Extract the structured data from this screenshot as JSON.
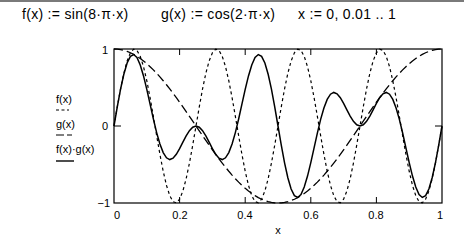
{
  "definitions": [
    {
      "text": "f(x) := sin(8·π·x)"
    },
    {
      "text": "g(x) := cos(2·π·x)"
    },
    {
      "text": "x := 0, 0.01 .. 1"
    }
  ],
  "legend": [
    {
      "label": "f(x)",
      "style": "dotted"
    },
    {
      "label": "g(x)",
      "style": "dashed"
    },
    {
      "label": "f(x)·g(x)",
      "style": "solid"
    }
  ],
  "axes": {
    "xlabel": "x",
    "x_ticks": [
      "0",
      "0.2",
      "0.4",
      "0.6",
      "0.8",
      "1"
    ],
    "y_ticks": [
      "1",
      "0",
      "−1"
    ]
  },
  "colors": {
    "line": "#000000",
    "frame": "#000000",
    "background": "#ffffff"
  },
  "chart_data": {
    "type": "line",
    "title": "",
    "xlabel": "x",
    "ylabel": "",
    "xlim": [
      0,
      1
    ],
    "ylim": [
      -1,
      1
    ],
    "x_ticks": [
      0,
      0.2,
      0.4,
      0.6,
      0.8,
      1
    ],
    "y_ticks": [
      -1,
      0,
      1
    ],
    "grid": false,
    "legend_position": "left",
    "x": {
      "start": 0,
      "step": 0.01,
      "end": 1
    },
    "series": [
      {
        "name": "f(x)",
        "expression": "sin(8·π·x)",
        "style": "dotted",
        "sample_points": [
          [
            0,
            0
          ],
          [
            0.0625,
            1
          ],
          [
            0.125,
            0
          ],
          [
            0.1875,
            -1
          ],
          [
            0.25,
            0
          ],
          [
            0.3125,
            1
          ],
          [
            0.375,
            0
          ],
          [
            0.4375,
            -1
          ],
          [
            0.5,
            0
          ],
          [
            0.5625,
            1
          ],
          [
            0.625,
            0
          ],
          [
            0.6875,
            -1
          ],
          [
            0.75,
            0
          ],
          [
            0.8125,
            1
          ],
          [
            0.875,
            0
          ],
          [
            0.9375,
            -1
          ],
          [
            1,
            0
          ]
        ]
      },
      {
        "name": "g(x)",
        "expression": "cos(2·π·x)",
        "style": "dashed",
        "sample_points": [
          [
            0,
            1
          ],
          [
            0.125,
            0.707
          ],
          [
            0.25,
            0
          ],
          [
            0.375,
            -0.707
          ],
          [
            0.5,
            -1
          ],
          [
            0.625,
            -0.707
          ],
          [
            0.75,
            0
          ],
          [
            0.875,
            0.707
          ],
          [
            1,
            1
          ]
        ]
      },
      {
        "name": "f(x)·g(x)",
        "expression": "sin(8·π·x)·cos(2·π·x)",
        "style": "solid",
        "sample_points": [
          [
            0,
            0
          ],
          [
            0.05,
            0.94
          ],
          [
            0.125,
            0
          ],
          [
            0.17,
            -0.45
          ],
          [
            0.25,
            0
          ],
          [
            0.33,
            -0.45
          ],
          [
            0.375,
            0
          ],
          [
            0.44,
            0.94
          ],
          [
            0.5,
            0
          ],
          [
            0.56,
            -0.94
          ],
          [
            0.625,
            0
          ],
          [
            0.67,
            0.45
          ],
          [
            0.75,
            0
          ],
          [
            0.83,
            0.45
          ],
          [
            0.875,
            0
          ],
          [
            0.95,
            -0.94
          ],
          [
            1,
            0
          ]
        ]
      }
    ]
  }
}
